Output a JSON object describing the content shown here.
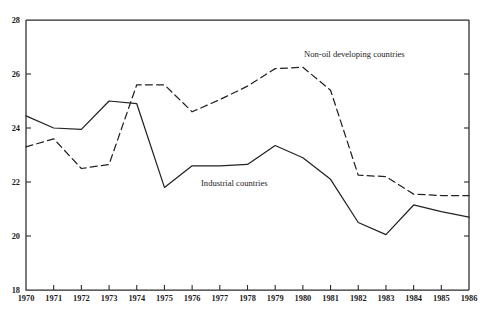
{
  "figure": {
    "title": "",
    "top_caption_faint": "",
    "background": "#ffffff",
    "ink_color": "#232323"
  },
  "axes": {
    "y_ticks": [
      "28",
      "26",
      "24",
      "22",
      "20",
      "18"
    ],
    "x_ticks": [
      "1970",
      "1971",
      "1972",
      "1973",
      "1974",
      "1975",
      "1976",
      "1977",
      "1978",
      "1979",
      "1980",
      "1981",
      "1982",
      "1983",
      "1984",
      "1985",
      "1986"
    ],
    "y_label": "",
    "x_label": ""
  },
  "annotations": {
    "non_oil_label": "Non-oil developing countries",
    "industrial_label": "Industrial countries"
  },
  "chart_data": {
    "type": "line",
    "title": "",
    "xlabel": "",
    "ylabel": "",
    "xlim": [
      1970,
      1986
    ],
    "ylim": [
      18,
      28
    ],
    "y_tick_values": [
      28,
      26,
      24,
      22,
      20,
      18
    ],
    "grid": false,
    "legend": "inline-annotations",
    "x": [
      1970,
      1971,
      1972,
      1973,
      1974,
      1975,
      1976,
      1977,
      1978,
      1979,
      1980,
      1981,
      1982,
      1983,
      1984,
      1985,
      1986
    ],
    "series": [
      {
        "name": "Industrial countries",
        "style": "solid",
        "color": "#232323",
        "values": [
          24.45,
          24.0,
          23.95,
          25.0,
          24.9,
          21.8,
          22.6,
          22.6,
          22.65,
          23.35,
          22.9,
          22.1,
          20.5,
          20.05,
          21.15,
          20.9,
          20.7
        ]
      },
      {
        "name": "Non-oil developing countries",
        "style": "dashed",
        "color": "#232323",
        "values": [
          23.3,
          23.6,
          22.5,
          22.65,
          25.6,
          25.6,
          24.6,
          25.05,
          25.55,
          26.2,
          26.25,
          25.4,
          22.25,
          22.2,
          21.55,
          21.5,
          21.5
        ]
      }
    ]
  }
}
